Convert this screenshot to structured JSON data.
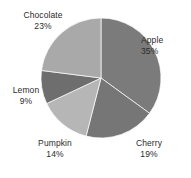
{
  "chart_data": {
    "type": "pie",
    "title": "",
    "subtitle": "",
    "xlabel": "",
    "ylabel": "",
    "legend_position": "none",
    "grid": false,
    "start_angle_deg": 0,
    "direction": "clockwise",
    "categories": [
      "Apple",
      "Cherry",
      "Pumpkin",
      "Lemon",
      "Chocolate"
    ],
    "values": [
      35,
      19,
      14,
      9,
      23
    ],
    "value_unit": "%",
    "slices": [
      {
        "name": "Apple",
        "value": 35,
        "label": "Apple",
        "value_label": "35%",
        "color": "#7b7b7b",
        "start_deg": 0,
        "end_deg": 126
      },
      {
        "name": "Cherry",
        "value": 19,
        "label": "Cherry",
        "value_label": "19%",
        "color": "#767676",
        "start_deg": 126,
        "end_deg": 194.4
      },
      {
        "name": "Pumpkin",
        "value": 14,
        "label": "Pumpkin",
        "value_label": "14%",
        "color": "#b6b6b6",
        "start_deg": 194.4,
        "end_deg": 244.8
      },
      {
        "name": "Lemon",
        "value": 9,
        "label": "Lemon",
        "value_label": "9%",
        "color": "#6e6e6e",
        "start_deg": 244.8,
        "end_deg": 277.2
      },
      {
        "name": "Chocolate",
        "value": 23,
        "label": "Chocolate",
        "value_label": "23%",
        "color": "#a9a9a9",
        "start_deg": 277.2,
        "end_deg": 360
      }
    ]
  },
  "colors": {
    "background": "#ffffff",
    "label_text": "#2b2b2b",
    "slice_apple": "#7b7b7b",
    "slice_cherry": "#767676",
    "slice_pumpkin": "#b6b6b6",
    "slice_lemon": "#6e6e6e",
    "slice_chocolate": "#a9a9a9"
  }
}
